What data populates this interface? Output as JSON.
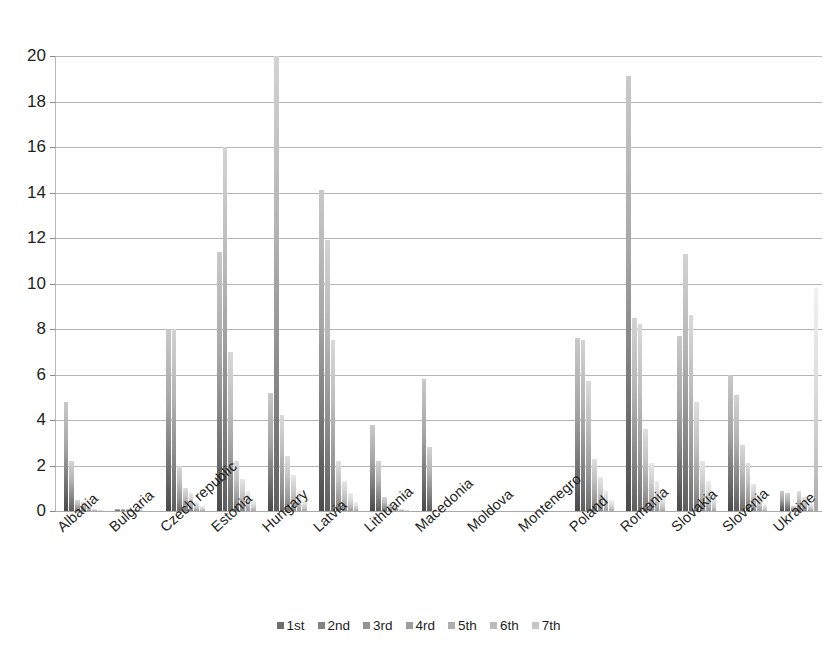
{
  "chart_data": {
    "type": "bar",
    "title": "",
    "subtitle": "",
    "xlabel": "",
    "ylabel": "",
    "ylim": [
      0,
      20
    ],
    "y_ticks": [
      0,
      2,
      4,
      6,
      8,
      10,
      12,
      14,
      16,
      18,
      20
    ],
    "grid": true,
    "grid_axis": "y",
    "legend_position": "bottom",
    "legend": [
      "1st",
      "2nd",
      "3rd",
      "4rd",
      "5th",
      "6th",
      "7th"
    ],
    "categories": [
      "Albania",
      "Bulgaria",
      "Czech republic",
      "Estonia",
      "Hungary",
      "Latvia",
      "Lithuania",
      "Macedonia",
      "Moldova",
      "Montenegro",
      "Poland",
      "Romania",
      "Slovakia",
      "Slovenia",
      "Ukraine"
    ],
    "series": [
      {
        "name": "1st",
        "values": [
          4.8,
          0.1,
          8.0,
          11.4,
          5.2,
          14.1,
          3.8,
          5.8,
          0,
          0,
          7.6,
          19.1,
          7.7,
          6.0,
          0.9
        ]
      },
      {
        "name": "2nd",
        "values": [
          2.2,
          0.1,
          8.0,
          16.0,
          20.0,
          11.9,
          2.2,
          2.8,
          0,
          0,
          7.5,
          8.5,
          11.3,
          5.1,
          0.8
        ]
      },
      {
        "name": "3rd",
        "values": [
          0.5,
          0.1,
          2.0,
          7.0,
          4.2,
          7.5,
          0.6,
          0,
          0,
          0,
          5.7,
          8.2,
          8.6,
          2.9,
          0.2
        ]
      },
      {
        "name": "4rd",
        "values": [
          0.4,
          0.05,
          1.0,
          2.2,
          2.4,
          2.2,
          0.3,
          0,
          0,
          0,
          2.3,
          3.6,
          4.8,
          2.1,
          0.9
        ]
      },
      {
        "name": "5th",
        "values": [
          0.2,
          0.05,
          0.8,
          1.4,
          1.6,
          1.3,
          0.2,
          0,
          0,
          0,
          1.5,
          2.1,
          2.2,
          1.2,
          0.6
        ]
      },
      {
        "name": "6th",
        "values": [
          0.1,
          0.0,
          0.4,
          0.9,
          0.9,
          0.8,
          0.1,
          0,
          0,
          0,
          0.9,
          1.3,
          1.3,
          0.7,
          0.3
        ]
      },
      {
        "name": "7th",
        "values": [
          0.05,
          0.0,
          0.2,
          0.5,
          0.5,
          0.4,
          0.05,
          0,
          0,
          0,
          0.5,
          0.7,
          0.7,
          0.3,
          9.8
        ]
      }
    ]
  },
  "colors": {
    "grid": "#a9a9a9",
    "text": "#231f20",
    "background": "#ffffff",
    "series": [
      "#6e6e6e",
      "#838383",
      "#939393",
      "#9d9d9d",
      "#aeaeae",
      "#bbbbbb",
      "#c6c6c6"
    ]
  }
}
